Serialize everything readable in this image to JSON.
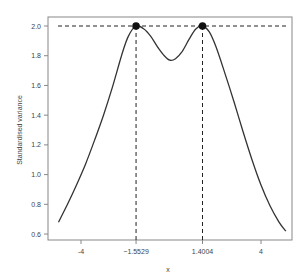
{
  "chart_data": {
    "type": "line",
    "title": "",
    "xlabel": "x",
    "ylabel": "Standardised variance",
    "xlim": [
      -5.5,
      5.5
    ],
    "ylim": [
      0.6,
      2.0
    ],
    "grid": false,
    "legend": null,
    "x_ticks": [
      {
        "value": -4,
        "label": "-4"
      },
      {
        "value": -1.5529,
        "label": "−1.5529"
      },
      {
        "value": 1.4004,
        "label": "1.4004"
      },
      {
        "value": 4,
        "label": "4"
      }
    ],
    "y_ticks": [
      {
        "value": 0.6,
        "label": "0.6"
      },
      {
        "value": 0.8,
        "label": "0.8"
      },
      {
        "value": 1.0,
        "label": "1.0"
      },
      {
        "value": 1.2,
        "label": "1.2"
      },
      {
        "value": 1.4,
        "label": "1.4"
      },
      {
        "value": 1.6,
        "label": "1.6"
      },
      {
        "value": 1.8,
        "label": "1.8"
      },
      {
        "value": 2.0,
        "label": "2.0"
      }
    ],
    "series": [
      {
        "name": "standardised variance",
        "x": [
          -5.0,
          -4.6,
          -4.2,
          -3.8,
          -3.4,
          -3.0,
          -2.6,
          -2.2,
          -1.9,
          -1.5529,
          -1.2,
          -0.9,
          -0.6,
          -0.3,
          -0.05,
          0.2,
          0.5,
          0.8,
          1.1,
          1.4004,
          1.7,
          2.0,
          2.4,
          2.8,
          3.2,
          3.6,
          4.0,
          4.4,
          4.8,
          5.1
        ],
        "y": [
          0.68,
          0.8,
          0.93,
          1.07,
          1.23,
          1.4,
          1.59,
          1.8,
          1.93,
          2.0,
          1.98,
          1.93,
          1.86,
          1.8,
          1.77,
          1.78,
          1.83,
          1.91,
          1.98,
          2.0,
          1.96,
          1.86,
          1.68,
          1.49,
          1.29,
          1.1,
          0.93,
          0.79,
          0.68,
          0.62
        ]
      }
    ],
    "annotations": [
      {
        "type": "hline",
        "y": 2.0,
        "style": "dashed"
      },
      {
        "type": "vline",
        "x": -1.5529,
        "style": "dashed",
        "from_y": 0.6,
        "to_y": 2.0
      },
      {
        "type": "vline",
        "x": 1.4004,
        "style": "dashed",
        "from_y": 0.6,
        "to_y": 2.0
      },
      {
        "type": "point",
        "x": -1.5529,
        "y": 2.0,
        "label": "maximum"
      },
      {
        "type": "point",
        "x": 1.4004,
        "y": 2.0,
        "label": "maximum"
      }
    ]
  },
  "layout": {
    "plot": {
      "left": 48,
      "top": 17,
      "right": 292,
      "bottom": 240
    },
    "x_px_per_unit": 22.5,
    "x_origin_px": 171,
    "y_px_per_unit": 148.6,
    "y_origin_val": 2.0,
    "y_origin_px": 26
  },
  "colors": {
    "line": "#333333",
    "axis": "#777777",
    "text": "#444444"
  }
}
